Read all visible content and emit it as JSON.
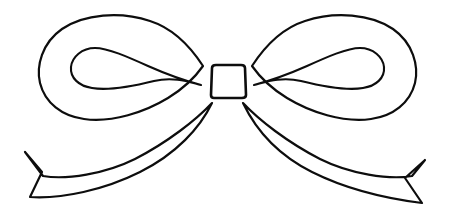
{
  "document": {
    "title": "Bow Ribbon Line Art",
    "subject": "decorative-bow",
    "style": "black outline line drawing",
    "background_color": "#ffffff",
    "stroke_color": "#0d0d0d",
    "fill_color": "#ffffff",
    "canvas": {
      "width": 450,
      "height": 220
    }
  },
  "artwork": {
    "name": "bow-ribbon",
    "parts": [
      {
        "id": "left-outer-loop",
        "label": "Left Outer Loop"
      },
      {
        "id": "left-inner-loop",
        "label": "Left Inner Loop"
      },
      {
        "id": "right-outer-loop",
        "label": "Right Outer Loop"
      },
      {
        "id": "right-inner-loop",
        "label": "Right Inner Loop"
      },
      {
        "id": "left-tail",
        "label": "Left Tail Ribbon"
      },
      {
        "id": "right-tail",
        "label": "Right Tail Ribbon"
      },
      {
        "id": "center-knot",
        "label": "Center Knot"
      }
    ],
    "paths": {
      "left_outer_loop": "M 203 66 C 190 46 172 28 150 21 C 120 11 84 14 62 29 C 42 43 36 66 40 83 C 45 103 62 116 84 119 C 112 123 145 112 168 98 C 186 87 196 76 203 66 Z",
      "left_inner_loop": "M 201 85 C 186 81 166 74 148 66 C 128 57 108 48 95 48 C 82 48 72 57 71 67 C 70 78 79 86 92 88 C 110 91 134 86 154 81 C 175 76 192 83 201 85 Z",
      "right_outer_loop": "M 252 66 C 265 46 283 28 305 21 C 335 11 371 14 393 29 C 413 43 419 66 415 83 C 410 103 393 116 371 119 C 343 123 310 112 287 98 C 269 87 259 76 252 66 Z",
      "right_inner_loop": "M 254 85 C 269 81 289 74 307 66 C 327 57 347 48 360 48 C 373 48 383 57 384 67 C 385 78 376 86 363 88 C 345 91 321 86 301 81 C 280 76 263 83 254 85 Z",
      "left_tail": "M 212 103 C 196 120 168 142 135 159 C 105 174 66 180 43 176 L 25 152 L 42 172 L 30 197 C 62 199 104 190 140 172 C 176 154 200 128 212 103 Z",
      "right_tail": "M 243 103 C 259 120 287 142 320 159 C 350 174 389 180 412 176 L 425 160 L 405 178 L 422 203 C 390 199 348 190 312 172 C 276 154 255 128 243 103 Z",
      "center_knot": "M 212 68 C 212 66 214 65 216 65 L 241 65 C 243 65 245 66 245 68 L 246 95 C 246 97 244 98 242 98 L 214 98 C 212 98 211 97 211 95 Z"
    }
  }
}
